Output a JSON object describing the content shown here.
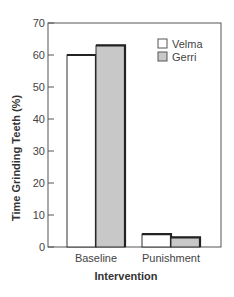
{
  "chart_data": {
    "type": "bar",
    "title": "",
    "xlabel": "Intervention",
    "ylabel": "Time Grinding Teeth (%)",
    "categories": [
      "Baseline",
      "Punishment"
    ],
    "series": [
      {
        "name": "Velma",
        "values": [
          60,
          4
        ],
        "color": "#ffffff"
      },
      {
        "name": "Gerri",
        "values": [
          63,
          3
        ],
        "color": "#c8c8c8"
      }
    ],
    "ylim": [
      0,
      70
    ],
    "yticks": [
      0,
      10,
      20,
      30,
      40,
      50,
      60,
      70
    ],
    "grid": false,
    "legend_position": "upper right"
  },
  "colors": {
    "axis": "#555555",
    "bar_edge": "#333333",
    "bar_top_edge": "#222222"
  }
}
